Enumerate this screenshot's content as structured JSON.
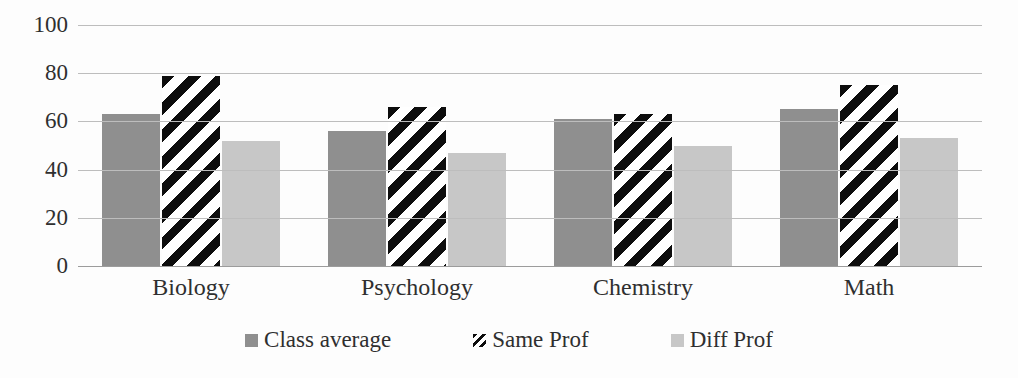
{
  "chart_data": {
    "type": "bar",
    "title": "",
    "categories": [
      "Biology",
      "Psychology",
      "Chemistry",
      "Math"
    ],
    "series": [
      {
        "name": "Class average",
        "values": [
          63,
          56,
          61,
          65
        ],
        "fill": "solid",
        "color": "#8f8f8f"
      },
      {
        "name": "Same Prof",
        "values": [
          79,
          66,
          63,
          75
        ],
        "fill": "diagonal-stripes",
        "color": "#0d0d0d",
        "bg": "#ffffff"
      },
      {
        "name": "Diff Prof",
        "values": [
          52,
          47,
          50,
          53
        ],
        "fill": "solid",
        "color": "#c7c7c7"
      }
    ],
    "xlabel": "",
    "ylabel": "",
    "ylim": [
      0,
      100
    ],
    "yticks": [
      0,
      20,
      40,
      60,
      80,
      100
    ],
    "grid": "horizontal",
    "legend_position": "bottom",
    "legend_labels": [
      "Class average",
      "Same Prof",
      "Diff Prof"
    ]
  },
  "colors": {
    "background": "#fdfdfd",
    "gridline": "#bdbdbd",
    "axis_baseline": "#9c9c9c",
    "text": "#2f2f2f"
  }
}
